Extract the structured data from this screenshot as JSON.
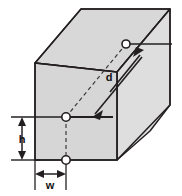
{
  "figure": {
    "type": "technical-line-drawing",
    "background_color": "#ffffff",
    "face_fill_color": "#d6d6d6",
    "face_fill_color_light": "#dcdcdc",
    "line_color": "#231f20",
    "marker_fill_color": "#ffffff"
  },
  "labels": {
    "height": "h",
    "width": "w",
    "depth": "d"
  },
  "markers": {
    "front_node": "node-front-face-center",
    "top_node": "node-top-rear",
    "bottom_node": "node-bottom-edge"
  },
  "dimensions": {
    "height_label_position": "left-outside",
    "width_label_position": "bottom-outside",
    "depth_label_position": "interior-diagonal"
  }
}
